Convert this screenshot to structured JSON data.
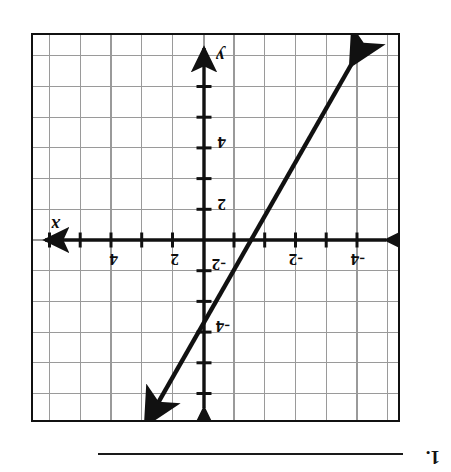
{
  "worksheet": {
    "problem_number": "1.",
    "answer_line": "answer-blank-rule"
  },
  "graph": {
    "frame": {
      "x": 51,
      "y": 50,
      "width": 369,
      "height": 389
    },
    "grid": {
      "cell_px": 30.75,
      "cols": 12,
      "rows": 12,
      "minor_color": "#9a9a9a",
      "show": true
    },
    "axes": {
      "color": "#111111",
      "x_axis_label": "x",
      "y_axis_label": "y",
      "origin_px": {
        "x": 194,
        "y": 180
      },
      "unit_px": 30.75,
      "x_range": [
        -6,
        6
      ],
      "y_range": [
        -6,
        6
      ],
      "tick_interval": 1,
      "arrowheads": [
        "left",
        "right",
        "up",
        "down"
      ]
    },
    "tick_labels": {
      "x_positive": [
        "2",
        "4"
      ],
      "x_negative": [
        "-2",
        "-4"
      ],
      "y_positive": [
        "2",
        "4"
      ],
      "y_negative": [
        "-2",
        "-4"
      ]
    },
    "line": {
      "color": "#111111",
      "stroke_width": 4.2,
      "double_arrow": true,
      "points_px": [
        {
          "x": 41,
          "y": 361
        },
        {
          "x": 259,
          "y": -12
        }
      ],
      "passes_through": [
        {
          "x": -0.3,
          "y": 0
        },
        {
          "x": 1.2,
          "y": 5
        }
      ],
      "description": "steep positive-slope line through roughly (0, 1) rising left-to-right"
    }
  },
  "colors": {
    "ink": "#111111",
    "grid": "#9a9a9a",
    "paper": "#ffffff"
  }
}
